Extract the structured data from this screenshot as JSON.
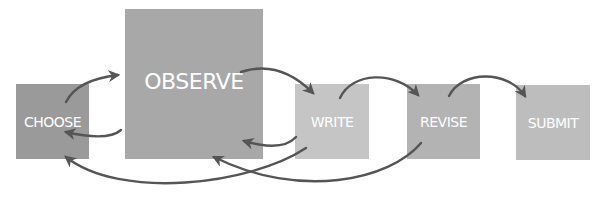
{
  "diagram": {
    "type": "process-flow",
    "nodes": [
      {
        "id": "choose",
        "label": "CHOOSE",
        "color": "#9a9a9a"
      },
      {
        "id": "observe",
        "label": "OBSERVE",
        "color": "#a8a8a8"
      },
      {
        "id": "write",
        "label": "WRITE",
        "color": "#c5c5c5"
      },
      {
        "id": "revise",
        "label": "REVISE",
        "color": "#b3b3b3"
      },
      {
        "id": "submit",
        "label": "SUBMIT",
        "color": "#bdbdbd"
      }
    ],
    "edges": [
      {
        "from": "choose",
        "to": "observe"
      },
      {
        "from": "observe",
        "to": "choose"
      },
      {
        "from": "observe",
        "to": "write"
      },
      {
        "from": "write",
        "to": "observe"
      },
      {
        "from": "write",
        "to": "choose"
      },
      {
        "from": "write",
        "to": "revise"
      },
      {
        "from": "revise",
        "to": "observe"
      },
      {
        "from": "revise",
        "to": "submit"
      }
    ],
    "arrow_color": "#555555"
  }
}
